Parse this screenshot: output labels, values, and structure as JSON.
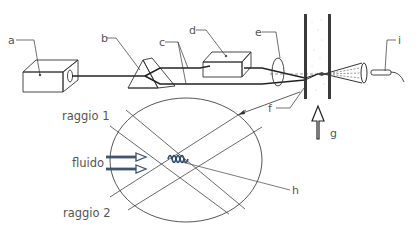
{
  "diagram": {
    "type": "schematic",
    "labels": {
      "a": "a",
      "b": "b",
      "c": "c",
      "d": "d",
      "e": "e",
      "f": "f",
      "g": "g",
      "h": "h",
      "i": "i"
    },
    "detail": {
      "beam1": "raggio 1",
      "beam2": "raggio 2",
      "fluid": "fluido"
    },
    "colors": {
      "line": "#333333",
      "text": "#555555",
      "flow_arrow": "#3d5570",
      "fringes": "#2f4a6a"
    }
  }
}
